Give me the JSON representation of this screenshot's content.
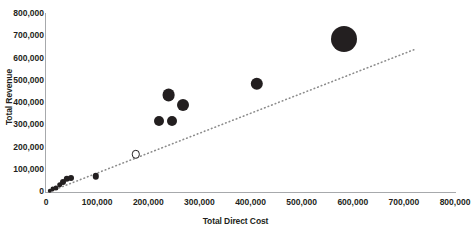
{
  "chart_data": {
    "type": "scatter",
    "title": "",
    "xlabel": "Total Direct Cost",
    "ylabel": "Total Revenue",
    "xlim": [
      0,
      800000
    ],
    "ylim": [
      0,
      800000
    ],
    "grid": false,
    "legend": null,
    "xticks": [
      "0",
      "100,000",
      "200,000",
      "300,000",
      "400,000",
      "500,000",
      "600,000",
      "700,000",
      "800,000"
    ],
    "xtick_values": [
      0,
      100000,
      200000,
      300000,
      400000,
      500000,
      600000,
      700000,
      800000
    ],
    "yticks": [
      "0",
      "100,000",
      "200,000",
      "300,000",
      "400,000",
      "500,000",
      "600,000",
      "700,000",
      "800,000"
    ],
    "ytick_values": [
      0,
      100000,
      200000,
      300000,
      400000,
      500000,
      600000,
      700000,
      800000
    ],
    "marker_color": "#231f20",
    "trendline": {
      "style": "dotted",
      "color": "#8c8c8c",
      "x": [
        5000,
        720000
      ],
      "y": [
        0,
        640000
      ]
    },
    "points": [
      {
        "x": 8000,
        "y": 6000,
        "size": 2.2,
        "filled": true
      },
      {
        "x": 13000,
        "y": 12000,
        "size": 2.4,
        "filled": true
      },
      {
        "x": 20000,
        "y": 20000,
        "size": 2.6,
        "filled": true
      },
      {
        "x": 27000,
        "y": 32000,
        "size": 2.8,
        "filled": true
      },
      {
        "x": 34000,
        "y": 45000,
        "size": 3.0,
        "filled": true
      },
      {
        "x": 41000,
        "y": 58000,
        "size": 3.2,
        "filled": true
      },
      {
        "x": 48000,
        "y": 62000,
        "size": 3.0,
        "filled": true
      },
      {
        "x": 97000,
        "y": 70000,
        "size": 3.2,
        "filled": true
      },
      {
        "x": 176000,
        "y": 170000,
        "size": 4.2,
        "filled": false
      },
      {
        "x": 222000,
        "y": 320000,
        "size": 5.0,
        "filled": true
      },
      {
        "x": 246000,
        "y": 320000,
        "size": 5.0,
        "filled": true
      },
      {
        "x": 240000,
        "y": 437000,
        "size": 6.4,
        "filled": true
      },
      {
        "x": 268000,
        "y": 393000,
        "size": 6.0,
        "filled": true
      },
      {
        "x": 412000,
        "y": 485000,
        "size": 6.2,
        "filled": true
      },
      {
        "x": 583000,
        "y": 688000,
        "size": 13.0,
        "filled": true
      }
    ]
  }
}
